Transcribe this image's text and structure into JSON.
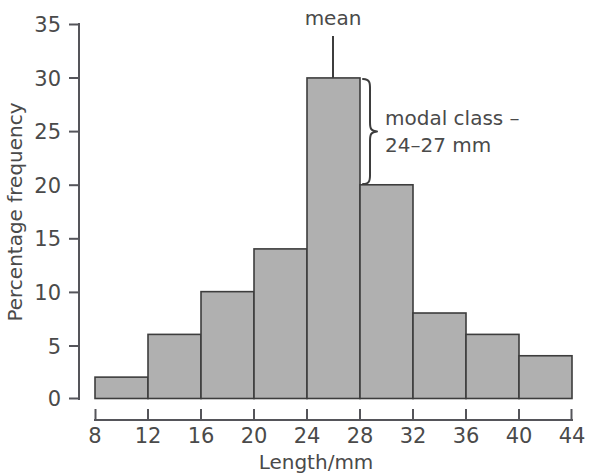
{
  "chart_data": {
    "type": "bar",
    "title": "",
    "subtitle": "",
    "xlabel": "Length/mm",
    "ylabel": "Percentage frequency",
    "xlim": [
      8,
      44
    ],
    "ylim": [
      0,
      35
    ],
    "grid": false,
    "legend": false,
    "bin_width": 4,
    "bin_edges": [
      8,
      12,
      16,
      20,
      24,
      28,
      32,
      36,
      40,
      44
    ],
    "categories": [
      "8-12",
      "12-16",
      "16-20",
      "20-24",
      "24-28",
      "28-32",
      "32-36",
      "36-40",
      "40-44"
    ],
    "values": [
      2,
      6,
      10,
      14,
      30,
      20,
      8,
      6,
      4
    ],
    "x_ticks": [
      "8",
      "12",
      "16",
      "20",
      "24",
      "28",
      "32",
      "36",
      "40",
      "44"
    ],
    "y_ticks": [
      "0",
      "5",
      "10",
      "15",
      "20",
      "25",
      "30",
      "35"
    ],
    "annotations": [
      {
        "name": "mean",
        "label": "mean",
        "x": 26,
        "y": 30,
        "style": "leader-line-above-bar"
      },
      {
        "name": "modal-class",
        "label_line1": "modal class –",
        "label_line2": "24–27 mm",
        "style": "curly-brace-right-of-modal-bar",
        "brace_from_value": 30,
        "brace_to_value": 20
      }
    ],
    "colors": {
      "bar_fill": "#b0b0b0",
      "bar_stroke": "#3d3d3d",
      "axis": "#55555a",
      "text": "#4a4a4a",
      "background": "#ffffff"
    }
  }
}
